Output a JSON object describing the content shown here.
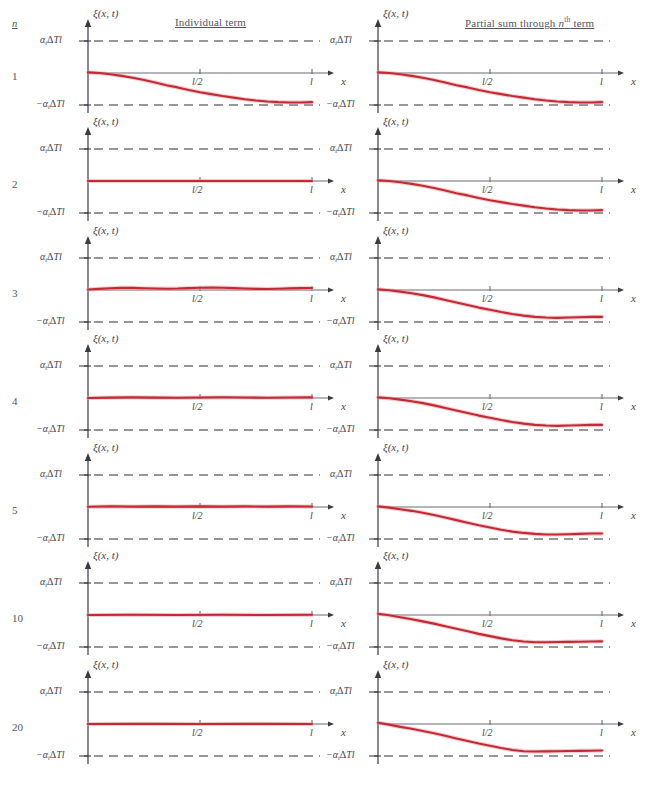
{
  "figure": {
    "width": 646,
    "height": 790,
    "background": "#ffffff"
  },
  "headers": {
    "n_label": "n",
    "individual_term": "Individual term",
    "partial_sum_prefix": "Partial sum through ",
    "partial_sum_var": "n",
    "partial_sum_sup": "th",
    "partial_sum_suffix": " term"
  },
  "axis": {
    "y_axis_name": "ξ(x, t)",
    "y_top_label": "α",
    "y_top_sub": "t",
    "y_top_rest": "ΔTl",
    "y_bottom_label": "−α",
    "y_bottom_sub": "t",
    "y_bottom_rest": "ΔTl",
    "x_tick_mid": "l/2",
    "x_tick_end": "l",
    "x_axis_name": "x"
  },
  "colors": {
    "curve": "#c32a33",
    "curve_halo": "#e8a3a8",
    "axis": "#6b6b78",
    "dashed": "#2f2f38",
    "text": "#55555f",
    "background": "#ffffff"
  },
  "chart_data": {
    "type": "line",
    "xlabel": "x",
    "ylabel": "ξ(x, t)",
    "xlim": [
      0,
      1
    ],
    "ylim": [
      -1,
      1
    ],
    "xticks": [
      0.5,
      1.0
    ],
    "xticklabels": [
      "l/2",
      "l"
    ],
    "yticks": [
      -1,
      1
    ],
    "yticklabels": [
      "−α_tΔTl",
      "α_tΔTl"
    ],
    "grid": false,
    "legend": false,
    "dashed_reference_levels": [
      1,
      -1
    ],
    "note": "Each row n shows the n-th individual Fourier term (left) and the partial sum through the n-th term (right). Even terms vanish, so partial sums change only at odd n. Curves are sampled as [x, y] pairs with y normalized so ±1 equals ±α_tΔTl.",
    "rows": [
      {
        "n": "1",
        "individual": {
          "label": "n = 1 individual term",
          "points": [
            [
              0,
              0.02
            ],
            [
              0.05,
              0.0
            ],
            [
              0.1,
              -0.04
            ],
            [
              0.15,
              -0.09
            ],
            [
              0.2,
              -0.15
            ],
            [
              0.25,
              -0.22
            ],
            [
              0.3,
              -0.3
            ],
            [
              0.35,
              -0.38
            ],
            [
              0.4,
              -0.45
            ],
            [
              0.45,
              -0.53
            ],
            [
              0.5,
              -0.6
            ],
            [
              0.55,
              -0.66
            ],
            [
              0.6,
              -0.72
            ],
            [
              0.65,
              -0.77
            ],
            [
              0.7,
              -0.82
            ],
            [
              0.75,
              -0.86
            ],
            [
              0.8,
              -0.89
            ],
            [
              0.85,
              -0.91
            ],
            [
              0.9,
              -0.92
            ],
            [
              0.95,
              -0.92
            ],
            [
              1.0,
              -0.91
            ]
          ]
        },
        "partial": {
          "label": "partial sum through n = 1",
          "points": [
            [
              0,
              0.02
            ],
            [
              0.05,
              0.0
            ],
            [
              0.1,
              -0.04
            ],
            [
              0.15,
              -0.09
            ],
            [
              0.2,
              -0.15
            ],
            [
              0.25,
              -0.22
            ],
            [
              0.3,
              -0.3
            ],
            [
              0.35,
              -0.38
            ],
            [
              0.4,
              -0.45
            ],
            [
              0.45,
              -0.53
            ],
            [
              0.5,
              -0.6
            ],
            [
              0.55,
              -0.66
            ],
            [
              0.6,
              -0.72
            ],
            [
              0.65,
              -0.77
            ],
            [
              0.7,
              -0.82
            ],
            [
              0.75,
              -0.86
            ],
            [
              0.8,
              -0.89
            ],
            [
              0.85,
              -0.91
            ],
            [
              0.9,
              -0.92
            ],
            [
              0.95,
              -0.92
            ],
            [
              1.0,
              -0.91
            ]
          ]
        }
      },
      {
        "n": "2",
        "individual": {
          "label": "n = 2 individual term (vanishes)",
          "points": [
            [
              0,
              0.0
            ],
            [
              0.25,
              0.0
            ],
            [
              0.5,
              0.0
            ],
            [
              0.75,
              0.0
            ],
            [
              1.0,
              0.0
            ]
          ]
        },
        "partial": {
          "label": "partial sum through n = 2",
          "points": [
            [
              0,
              0.02
            ],
            [
              0.05,
              0.0
            ],
            [
              0.1,
              -0.04
            ],
            [
              0.15,
              -0.09
            ],
            [
              0.2,
              -0.15
            ],
            [
              0.25,
              -0.22
            ],
            [
              0.3,
              -0.3
            ],
            [
              0.35,
              -0.38
            ],
            [
              0.4,
              -0.45
            ],
            [
              0.45,
              -0.53
            ],
            [
              0.5,
              -0.6
            ],
            [
              0.55,
              -0.66
            ],
            [
              0.6,
              -0.72
            ],
            [
              0.65,
              -0.77
            ],
            [
              0.7,
              -0.82
            ],
            [
              0.75,
              -0.86
            ],
            [
              0.8,
              -0.89
            ],
            [
              0.85,
              -0.91
            ],
            [
              0.9,
              -0.92
            ],
            [
              0.95,
              -0.92
            ],
            [
              1.0,
              -0.91
            ]
          ]
        }
      },
      {
        "n": "3",
        "individual": {
          "label": "n = 3 individual term",
          "points": [
            [
              0,
              0.015
            ],
            [
              0.05,
              0.035
            ],
            [
              0.1,
              0.055
            ],
            [
              0.15,
              0.065
            ],
            [
              0.2,
              0.065
            ],
            [
              0.25,
              0.055
            ],
            [
              0.3,
              0.045
            ],
            [
              0.35,
              0.04
            ],
            [
              0.4,
              0.045
            ],
            [
              0.45,
              0.058
            ],
            [
              0.5,
              0.07
            ],
            [
              0.55,
              0.075
            ],
            [
              0.6,
              0.072
            ],
            [
              0.65,
              0.06
            ],
            [
              0.7,
              0.045
            ],
            [
              0.75,
              0.035
            ],
            [
              0.8,
              0.032
            ],
            [
              0.85,
              0.038
            ],
            [
              0.9,
              0.05
            ],
            [
              0.95,
              0.06
            ],
            [
              1.0,
              0.062
            ]
          ]
        },
        "partial": {
          "label": "partial sum through n = 3",
          "points": [
            [
              0,
              0.02
            ],
            [
              0.05,
              -0.01
            ],
            [
              0.1,
              -0.05
            ],
            [
              0.15,
              -0.1
            ],
            [
              0.2,
              -0.16
            ],
            [
              0.25,
              -0.23
            ],
            [
              0.3,
              -0.31
            ],
            [
              0.35,
              -0.39
            ],
            [
              0.4,
              -0.47
            ],
            [
              0.45,
              -0.55
            ],
            [
              0.5,
              -0.62
            ],
            [
              0.55,
              -0.69
            ],
            [
              0.6,
              -0.75
            ],
            [
              0.65,
              -0.8
            ],
            [
              0.7,
              -0.84
            ],
            [
              0.75,
              -0.86
            ],
            [
              0.8,
              -0.87
            ],
            [
              0.85,
              -0.86
            ],
            [
              0.9,
              -0.85
            ],
            [
              0.95,
              -0.84
            ],
            [
              1.0,
              -0.84
            ]
          ]
        }
      },
      {
        "n": "4",
        "individual": {
          "label": "n = 4 individual term (vanishes)",
          "points": [
            [
              0,
              0.0
            ],
            [
              0.1,
              0.012
            ],
            [
              0.2,
              0.018
            ],
            [
              0.3,
              0.012
            ],
            [
              0.4,
              0.006
            ],
            [
              0.5,
              0.014
            ],
            [
              0.6,
              0.022
            ],
            [
              0.7,
              0.016
            ],
            [
              0.8,
              0.008
            ],
            [
              0.9,
              0.014
            ],
            [
              1.0,
              0.018
            ]
          ]
        },
        "partial": {
          "label": "partial sum through n = 4",
          "points": [
            [
              0,
              0.02
            ],
            [
              0.05,
              -0.01
            ],
            [
              0.1,
              -0.05
            ],
            [
              0.15,
              -0.1
            ],
            [
              0.2,
              -0.16
            ],
            [
              0.25,
              -0.23
            ],
            [
              0.3,
              -0.31
            ],
            [
              0.35,
              -0.39
            ],
            [
              0.4,
              -0.47
            ],
            [
              0.45,
              -0.55
            ],
            [
              0.5,
              -0.62
            ],
            [
              0.55,
              -0.69
            ],
            [
              0.6,
              -0.75
            ],
            [
              0.65,
              -0.8
            ],
            [
              0.7,
              -0.84
            ],
            [
              0.75,
              -0.86
            ],
            [
              0.8,
              -0.87
            ],
            [
              0.85,
              -0.86
            ],
            [
              0.9,
              -0.85
            ],
            [
              0.95,
              -0.84
            ],
            [
              1.0,
              -0.84
            ]
          ]
        }
      },
      {
        "n": "5",
        "individual": {
          "label": "n = 5 individual term",
          "points": [
            [
              0,
              0.008
            ],
            [
              0.1,
              0.022
            ],
            [
              0.2,
              0.012
            ],
            [
              0.3,
              0.02
            ],
            [
              0.4,
              0.012
            ],
            [
              0.5,
              0.02
            ],
            [
              0.6,
              0.012
            ],
            [
              0.7,
              0.02
            ],
            [
              0.8,
              0.012
            ],
            [
              0.9,
              0.02
            ],
            [
              1.0,
              0.014
            ]
          ]
        },
        "partial": {
          "label": "partial sum through n = 5",
          "points": [
            [
              0,
              0.02
            ],
            [
              0.05,
              -0.02
            ],
            [
              0.1,
              -0.07
            ],
            [
              0.15,
              -0.12
            ],
            [
              0.2,
              -0.18
            ],
            [
              0.25,
              -0.25
            ],
            [
              0.3,
              -0.33
            ],
            [
              0.35,
              -0.41
            ],
            [
              0.4,
              -0.49
            ],
            [
              0.45,
              -0.57
            ],
            [
              0.5,
              -0.64
            ],
            [
              0.55,
              -0.71
            ],
            [
              0.6,
              -0.77
            ],
            [
              0.65,
              -0.81
            ],
            [
              0.7,
              -0.84
            ],
            [
              0.75,
              -0.86
            ],
            [
              0.8,
              -0.86
            ],
            [
              0.85,
              -0.85
            ],
            [
              0.9,
              -0.84
            ],
            [
              0.95,
              -0.83
            ],
            [
              1.0,
              -0.83
            ]
          ]
        }
      },
      {
        "n": "10",
        "individual": {
          "label": "n = 10 individual term (vanishes)",
          "points": [
            [
              0,
              0.0
            ],
            [
              0.2,
              0.006
            ],
            [
              0.4,
              0.0
            ],
            [
              0.6,
              0.006
            ],
            [
              0.8,
              0.0
            ],
            [
              1.0,
              0.006
            ]
          ]
        },
        "partial": {
          "label": "partial sum through n = 10",
          "points": [
            [
              0,
              0.04
            ],
            [
              0.05,
              -0.01
            ],
            [
              0.1,
              -0.07
            ],
            [
              0.15,
              -0.13
            ],
            [
              0.2,
              -0.2
            ],
            [
              0.25,
              -0.27
            ],
            [
              0.3,
              -0.35
            ],
            [
              0.35,
              -0.43
            ],
            [
              0.4,
              -0.51
            ],
            [
              0.45,
              -0.59
            ],
            [
              0.5,
              -0.66
            ],
            [
              0.55,
              -0.73
            ],
            [
              0.6,
              -0.79
            ],
            [
              0.65,
              -0.83
            ],
            [
              0.7,
              -0.85
            ],
            [
              0.75,
              -0.85
            ],
            [
              0.8,
              -0.845
            ],
            [
              0.85,
              -0.84
            ],
            [
              0.9,
              -0.835
            ],
            [
              0.95,
              -0.83
            ],
            [
              1.0,
              -0.825
            ]
          ]
        }
      },
      {
        "n": "20",
        "individual": {
          "label": "n = 20 individual term (vanishes)",
          "points": [
            [
              0,
              0.0
            ],
            [
              0.25,
              0.004
            ],
            [
              0.5,
              0.0
            ],
            [
              0.75,
              0.004
            ],
            [
              1.0,
              0.0
            ]
          ]
        },
        "partial": {
          "label": "partial sum through n = 20",
          "points": [
            [
              0,
              0.04
            ],
            [
              0.05,
              -0.02
            ],
            [
              0.1,
              -0.09
            ],
            [
              0.15,
              -0.15
            ],
            [
              0.2,
              -0.22
            ],
            [
              0.25,
              -0.29
            ],
            [
              0.3,
              -0.37
            ],
            [
              0.35,
              -0.45
            ],
            [
              0.4,
              -0.53
            ],
            [
              0.45,
              -0.61
            ],
            [
              0.5,
              -0.68
            ],
            [
              0.55,
              -0.75
            ],
            [
              0.6,
              -0.81
            ],
            [
              0.65,
              -0.85
            ],
            [
              0.7,
              -0.86
            ],
            [
              0.75,
              -0.855
            ],
            [
              0.8,
              -0.85
            ],
            [
              0.85,
              -0.845
            ],
            [
              0.9,
              -0.84
            ],
            [
              0.95,
              -0.835
            ],
            [
              1.0,
              -0.83
            ]
          ]
        }
      }
    ]
  }
}
